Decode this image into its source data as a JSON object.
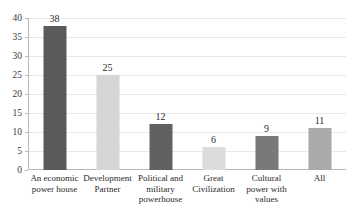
{
  "chart_data": {
    "type": "bar",
    "title": "",
    "subtitle": "",
    "xlabel": "",
    "ylabel": "",
    "ylim": [
      0,
      40
    ],
    "grid": true,
    "legend": "none",
    "categories": [
      "An economic power house",
      "Development Partner",
      "Political and military powerhouse",
      "Great Civilization",
      "Cultural power with values",
      "All"
    ],
    "values": [
      38,
      25,
      12,
      6,
      9,
      11
    ],
    "value_labels": [
      "38",
      "25",
      "12",
      "6",
      "9",
      "11"
    ],
    "bar_colors": [
      "#5a5a5a",
      "#d6d6d6",
      "#616161",
      "#dcdcdc",
      "#797979",
      "#aaaaaa"
    ],
    "y_ticks": [
      0,
      5,
      10,
      15,
      20,
      25,
      30,
      35,
      40
    ],
    "y_tick_labels": [
      "0",
      "5",
      "10",
      "15",
      "20",
      "25",
      "30",
      "35",
      "40"
    ],
    "axis_color": "#b9b9b9",
    "gridline_color": "#e8e8e8",
    "text_color": "#2b2b2b",
    "background_color": "#ffffff"
  }
}
